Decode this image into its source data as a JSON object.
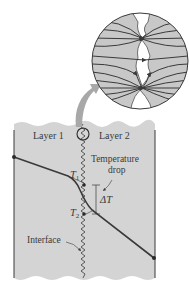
{
  "diagram": {
    "type": "thermal-contact-resistance",
    "labels": {
      "layer1": "Layer 1",
      "layer2": "Layer 2",
      "temperature_drop_line1": "Temperature",
      "temperature_drop_line2": "drop",
      "delta_t": "ΔT",
      "t1_main": "T",
      "t1_sub": "1",
      "t2_main": "T",
      "t2_sub": "2",
      "interface": "Interface"
    },
    "colors": {
      "panel_fill": "#d4d4d4",
      "magnifier_fill": "#c8c8c8",
      "line": "#3a3a3a",
      "arrow": "#a8a8a8",
      "gap_fill": "#ffffff"
    },
    "elements": {
      "magnifier_circle": "Magnified view of interface showing heat flow lines converging at contact points",
      "pointer_arrow": "Curved arrow from small circle on interface to magnified view",
      "temperature_profile": "Temperature decreases linearly across Layer 1, drops sharply at interface, then decreases linearly across Layer 2"
    }
  }
}
